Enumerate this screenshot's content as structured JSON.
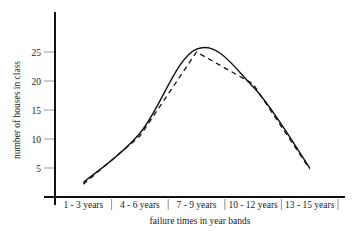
{
  "chart_data": {
    "type": "line",
    "title": "",
    "xlabel": "failure times in year bands",
    "ylabel": "number of houses in class",
    "categories": [
      "1 - 3 years",
      "4 - 6 years",
      "7 - 9 years",
      "10 - 12 years",
      "13 - 15 years"
    ],
    "yticks": [
      5,
      10,
      15,
      20,
      25
    ],
    "ylim": [
      0,
      30
    ],
    "grid": false,
    "legend": "none",
    "series": [
      {
        "name": "smoothed distribution",
        "style": "solid",
        "values": [
          2.5,
          11,
          25.5,
          19,
          5
        ]
      },
      {
        "name": "observed counts",
        "style": "dashed",
        "values": [
          2.2,
          10.5,
          25,
          19.5,
          4.8
        ]
      }
    ]
  }
}
